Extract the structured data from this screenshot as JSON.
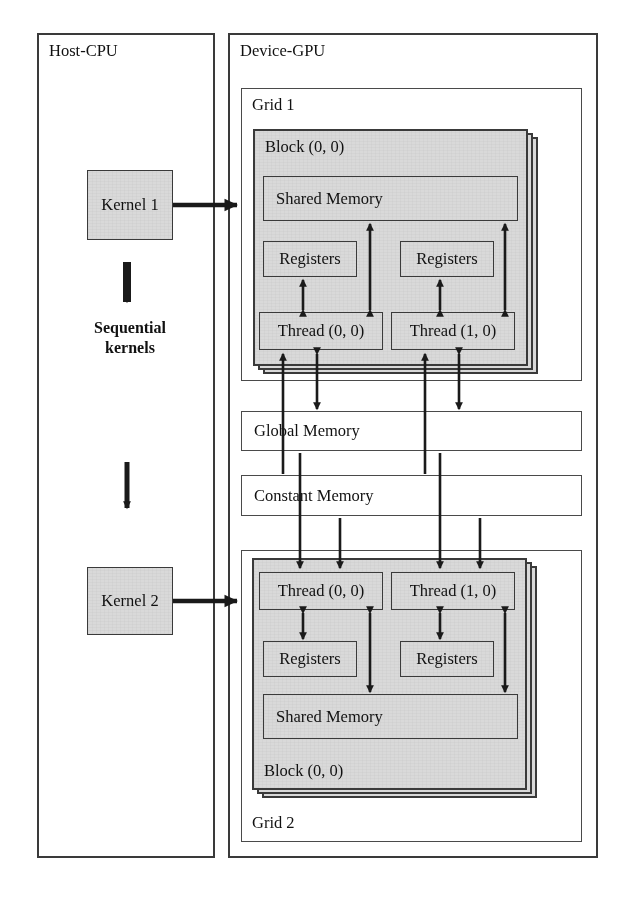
{
  "diagram": {
    "colors": {
      "fill_gray": "#d9d9d9",
      "stroke": "#3a3a3a",
      "background": "#ffffff",
      "text": "#111111"
    }
  },
  "host": {
    "label": "Host-CPU",
    "kernel1": "Kernel 1",
    "kernel2": "Kernel 2",
    "sequential_line1": "Sequential",
    "sequential_line2": "kernels",
    "arrow_down_top": "down-arrow-icon",
    "arrow_down_bottom": "down-arrow-icon"
  },
  "device": {
    "label": "Device-GPU"
  },
  "grid1": {
    "label": "Grid 1",
    "block_label": "Block (0, 0)",
    "shared_memory": "Shared Memory",
    "registers_left": "Registers",
    "registers_right": "Registers",
    "thread_left": "Thread (0, 0)",
    "thread_right": "Thread (1, 0)"
  },
  "grid2": {
    "label": "Grid 2",
    "block_label": "Block (0, 0)",
    "shared_memory": "Shared Memory",
    "registers_left": "Registers",
    "registers_right": "Registers",
    "thread_left": "Thread (0, 0)",
    "thread_right": "Thread (1, 0)"
  },
  "memory": {
    "global": "Global Memory",
    "constant": "Constant Memory"
  }
}
